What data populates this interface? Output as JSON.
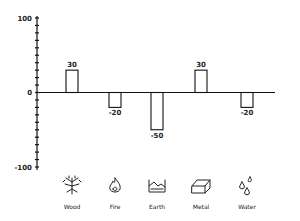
{
  "chart_data": {
    "type": "bar",
    "title": "",
    "xlabel": "",
    "ylabel": "",
    "categories": [
      "Wood",
      "Fire",
      "Earth",
      "Metal",
      "Water"
    ],
    "values": [
      30,
      -20,
      -50,
      30,
      -20
    ],
    "value_labels": [
      "30",
      "-20",
      "-50",
      "30",
      "-20"
    ],
    "ylim": [
      -100,
      100
    ],
    "ytick_labels": [
      "100",
      "0",
      "-100"
    ],
    "ytick_values": [
      100,
      0,
      -100
    ],
    "minor_tick_step": 10,
    "grid": false,
    "category_icons": [
      "tree-icon",
      "flame-icon",
      "earth-icon",
      "metal-ingot-icon",
      "water-drops-icon"
    ]
  }
}
